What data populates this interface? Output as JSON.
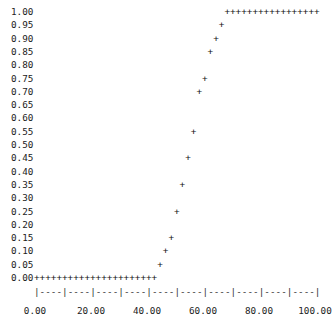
{
  "chart_data": {
    "type": "scatter",
    "title": "",
    "xlabel": "",
    "ylabel": "",
    "marker": "+",
    "style": "ascii",
    "grid": false,
    "legend": null,
    "xlim": [
      0,
      100
    ],
    "ylim": [
      0,
      1
    ],
    "x_ticks": [
      "0.00",
      "20.00",
      "40.00",
      "60.00",
      "80.00",
      "100.00"
    ],
    "y_ticks": [
      "1.00",
      "0.95",
      "0.90",
      "0.85",
      "0.80",
      "0.75",
      "0.70",
      "0.65",
      "0.60",
      "0.55",
      "0.50",
      "0.45",
      "0.40",
      "0.35",
      "0.30",
      "0.25",
      "0.20",
      "0.15",
      "0.10",
      "0.05",
      "0.00"
    ],
    "x_axis_line": "|----|----|----|----|----|----|----|----|----|----|",
    "series": [
      {
        "name": "",
        "x": [
          0,
          2,
          4,
          6,
          8,
          10,
          12,
          14,
          16,
          18,
          20,
          22,
          24,
          26,
          28,
          30,
          32,
          34,
          36,
          38,
          40,
          42,
          44,
          46,
          48,
          50,
          52,
          54,
          56,
          58,
          60,
          62,
          64,
          66,
          68,
          70,
          72,
          74,
          76,
          78,
          80,
          82,
          84,
          86,
          88,
          90,
          92,
          94,
          96,
          98,
          100
        ],
        "y": [
          0,
          0,
          0,
          0,
          0,
          0,
          0,
          0,
          0,
          0,
          0,
          0,
          0,
          0,
          0,
          0,
          0,
          0,
          0,
          0,
          0,
          0,
          0.05,
          0.1,
          0.15,
          0.25,
          0.35,
          0.45,
          0.55,
          0.7,
          0.75,
          0.85,
          0.9,
          0.95,
          1,
          1,
          1,
          1,
          1,
          1,
          1,
          1,
          1,
          1,
          1,
          1,
          1,
          1,
          1,
          1,
          1
        ]
      }
    ]
  }
}
